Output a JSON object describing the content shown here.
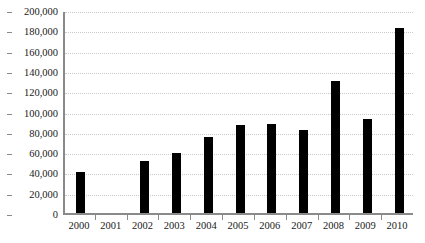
{
  "chart_data": {
    "type": "bar",
    "title": "",
    "subtitle": "",
    "xlabel": "",
    "ylabel": "",
    "categories": [
      "2000",
      "2001",
      "2002",
      "2003",
      "2004",
      "2005",
      "2006",
      "2007",
      "2008",
      "2009",
      "2010"
    ],
    "values": [
      40000,
      0,
      51000,
      59000,
      75000,
      87000,
      88000,
      82000,
      130000,
      93000,
      182000
    ],
    "ylim": [
      0,
      200000
    ],
    "ytick_step": 20000,
    "ytick_values": [
      0,
      20000,
      40000,
      60000,
      80000,
      100000,
      120000,
      140000,
      160000,
      180000,
      200000
    ],
    "ytick_labels": [
      "0",
      "20,000",
      "40,000",
      "60,000",
      "80,000",
      "100,000",
      "120,000",
      "140,000",
      "160,000",
      "180,000",
      "200,000"
    ],
    "grid": true,
    "grid_axis": "y",
    "legend": false,
    "legend_position": "none",
    "series": [
      {
        "name": "",
        "color": "#000000",
        "values": [
          40000,
          0,
          51000,
          59000,
          75000,
          87000,
          88000,
          82000,
          130000,
          93000,
          182000
        ]
      }
    ]
  },
  "style": {
    "bar_color": "#000000",
    "axis_color": "#8a8a8a",
    "grid_color": "#c9c9c9",
    "text_color": "#1a1a1a",
    "background": "#ffffff"
  }
}
